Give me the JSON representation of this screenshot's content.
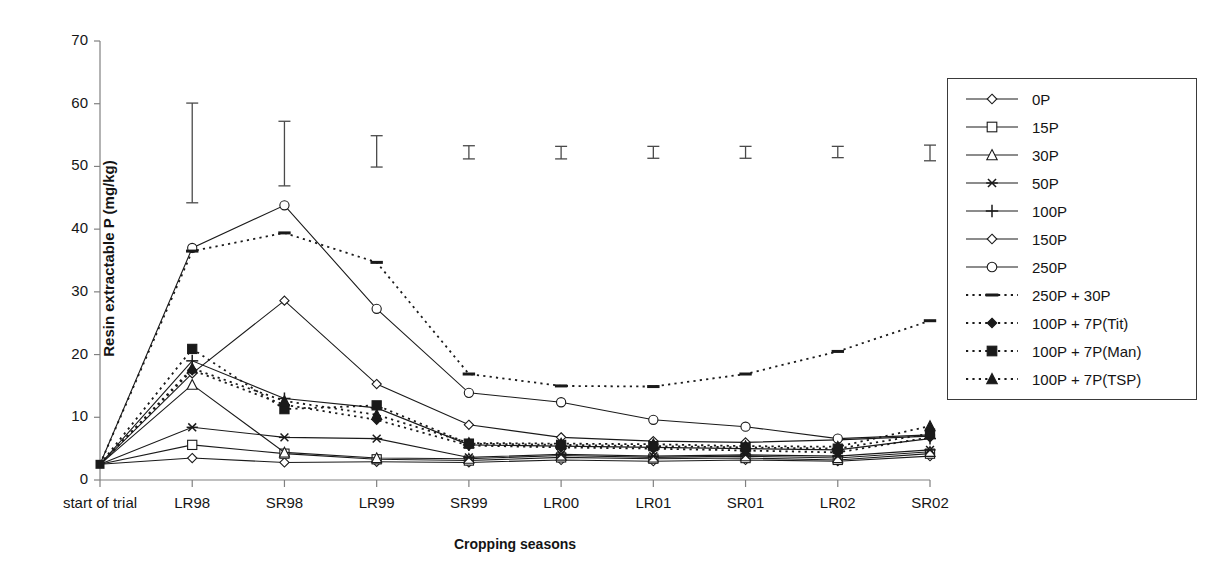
{
  "chart_data": {
    "type": "line",
    "title": "",
    "xlabel": "Cropping seasons",
    "ylabel": "Resin extractable P (mg/kg)",
    "ylim": [
      0,
      70
    ],
    "yticks": [
      0,
      10,
      20,
      30,
      40,
      50,
      60,
      70
    ],
    "grid": false,
    "legend_position": "right-outside",
    "categories": [
      "start of trial",
      "LR98",
      "SR98",
      "LR99",
      "SR99",
      "LR00",
      "LR01",
      "SR01",
      "LR02",
      "SR02"
    ],
    "series": [
      {
        "name": "0P",
        "marker": "open-diamond",
        "line": "solid",
        "values": [
          2.5,
          3.5,
          2.8,
          2.9,
          2.8,
          3.2,
          3.0,
          3.2,
          3.0,
          3.8
        ]
      },
      {
        "name": "15P",
        "marker": "open-square",
        "line": "solid",
        "values": [
          2.5,
          5.6,
          4.2,
          3.3,
          3.1,
          3.6,
          3.4,
          3.5,
          3.2,
          4.2
        ]
      },
      {
        "name": "30P",
        "marker": "open-triangle",
        "line": "solid",
        "values": [
          2.5,
          15.2,
          4.4,
          3.5,
          3.4,
          3.9,
          3.6,
          3.8,
          3.5,
          4.5
        ]
      },
      {
        "name": "50P",
        "marker": "star",
        "line": "solid",
        "values": [
          2.5,
          8.4,
          6.8,
          6.6,
          3.6,
          4.1,
          3.8,
          4.0,
          3.8,
          4.8
        ]
      },
      {
        "name": "100P",
        "marker": "plus",
        "line": "solid",
        "values": [
          2.5,
          19.0,
          13.0,
          11.5,
          5.6,
          5.4,
          5.2,
          5.0,
          4.8,
          6.6
        ]
      },
      {
        "name": "150P",
        "marker": "open-diamond",
        "line": "solid",
        "values": [
          2.5,
          17.0,
          28.6,
          15.3,
          8.8,
          6.8,
          6.2,
          6.0,
          6.4,
          7.0
        ]
      },
      {
        "name": "250P",
        "marker": "open-circle",
        "line": "solid",
        "values": [
          2.5,
          37.0,
          43.8,
          27.3,
          13.9,
          12.4,
          9.6,
          8.5,
          6.6,
          7.2
        ]
      },
      {
        "name": "250P + 30P",
        "marker": "dash",
        "line": "dotted",
        "values": [
          2.5,
          36.5,
          39.4,
          34.7,
          16.9,
          15.0,
          14.9,
          16.9,
          20.5,
          25.4
        ]
      },
      {
        "name": "100P + 7P(Tit)",
        "marker": "filled-diamond",
        "line": "dotted",
        "values": [
          2.5,
          17.5,
          12.0,
          9.6,
          5.5,
          5.2,
          5.0,
          4.7,
          4.4,
          6.8
        ]
      },
      {
        "name": "100P + 7P(Man)",
        "marker": "filled-square",
        "line": "dotted",
        "values": [
          2.5,
          20.9,
          11.3,
          11.9,
          5.8,
          5.6,
          5.4,
          5.2,
          5.0,
          7.4
        ]
      },
      {
        "name": "100P + 7P(TSP)",
        "marker": "filled-triangle",
        "line": "dotted",
        "values": [
          2.5,
          17.8,
          12.6,
          10.4,
          5.9,
          5.8,
          5.7,
          5.4,
          5.3,
          8.6
        ]
      }
    ],
    "error_bars": [
      {
        "category": "LR98",
        "low": 44.2,
        "high": 60.1
      },
      {
        "category": "SR98",
        "low": 46.9,
        "high": 57.2
      },
      {
        "category": "LR99",
        "low": 49.9,
        "high": 54.9
      },
      {
        "category": "SR99",
        "low": 51.2,
        "high": 53.3
      },
      {
        "category": "LR00",
        "low": 51.2,
        "high": 53.2
      },
      {
        "category": "LR01",
        "low": 51.3,
        "high": 53.2
      },
      {
        "category": "SR01",
        "low": 51.3,
        "high": 53.2
      },
      {
        "category": "LR02",
        "low": 51.4,
        "high": 53.2
      },
      {
        "category": "SR02",
        "low": 50.9,
        "high": 53.4
      }
    ]
  },
  "legend": {
    "items": [
      {
        "label": "0P"
      },
      {
        "label": "15P"
      },
      {
        "label": "30P"
      },
      {
        "label": "50P"
      },
      {
        "label": "100P"
      },
      {
        "label": "150P"
      },
      {
        "label": "250P"
      },
      {
        "label": "250P + 30P"
      },
      {
        "label": "100P + 7P(Tit)"
      },
      {
        "label": "100P + 7P(Man)"
      },
      {
        "label": "100P + 7P(TSP)"
      }
    ]
  },
  "colors": {
    "line": "#1a1a1a",
    "axis": "#808080",
    "text": "#141414",
    "background": "#ffffff"
  }
}
